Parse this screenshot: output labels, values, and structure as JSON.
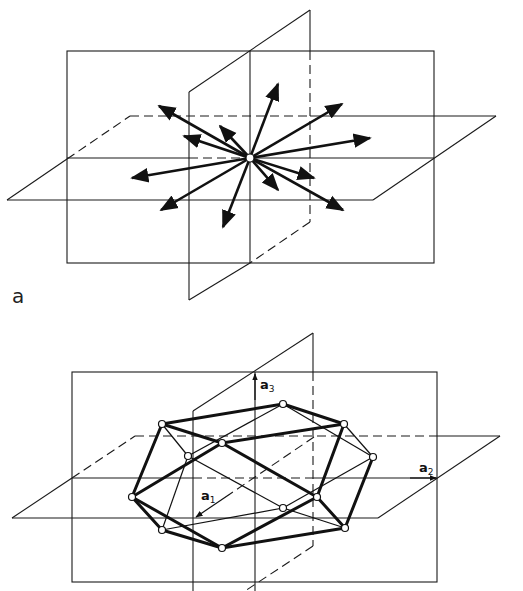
{
  "figure": {
    "panel_a_label": "a",
    "top": {
      "description": "Three mutually perpendicular planes with radiating vectors from center point",
      "center": [
        250,
        158
      ],
      "vector_count": 14
    },
    "bottom": {
      "description": "Polyhedron (cuboctahedron-like) inscribed in three perpendicular planes with basis vectors",
      "axes": [
        {
          "name": "a1",
          "base": "a",
          "subscript": "1"
        },
        {
          "name": "a2",
          "base": "a",
          "subscript": "2"
        },
        {
          "name": "a3",
          "base": "a",
          "subscript": "3"
        }
      ],
      "vertex_count": 12
    }
  },
  "colors": {
    "ink": "#111111",
    "background": "#ffffff"
  }
}
